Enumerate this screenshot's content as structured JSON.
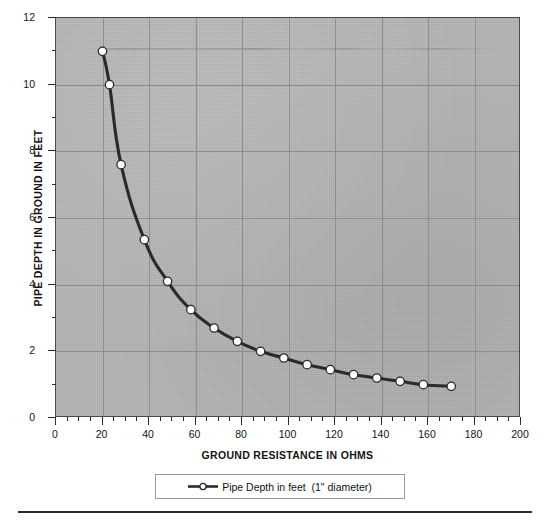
{
  "chart_data": {
    "type": "line",
    "title": "",
    "xlabel": "GROUND RESISTANCE IN OHMS",
    "ylabel": "PIPE DEPTH IN GROUND IN FEET",
    "xlim": [
      0,
      200
    ],
    "ylim": [
      0,
      12
    ],
    "x_major_ticks": [
      0,
      20,
      40,
      60,
      80,
      100,
      120,
      140,
      160,
      180,
      200
    ],
    "x_tick_labels": [
      "0",
      "20",
      "40",
      "60",
      "80",
      "100",
      "120",
      "140",
      "160",
      "180",
      "200"
    ],
    "x_minor_tick_step": 5,
    "y_major_ticks": [
      0,
      2,
      4,
      6,
      8,
      10,
      12
    ],
    "y_tick_labels": [
      "0",
      "2",
      "4",
      "6",
      "8",
      "10",
      "12"
    ],
    "y_minor_tick_step": 1,
    "grid": true,
    "grid_color": "#8e8e8e",
    "plot_background": "#b4b4b4",
    "legend_position": "below-axes",
    "series": [
      {
        "name": "Pipe Depth in feet  (1\" diameter)",
        "line_color": "#2a2a2a",
        "marker": "circle-open",
        "marker_fill": "#ffffff",
        "x": [
          20,
          23,
          28,
          38,
          48,
          58,
          68,
          78,
          88,
          98,
          108,
          118,
          128,
          138,
          148,
          158,
          170
        ],
        "y": [
          11.0,
          10.0,
          7.6,
          5.35,
          4.1,
          3.25,
          2.7,
          2.3,
          2.0,
          1.8,
          1.6,
          1.45,
          1.3,
          1.2,
          1.1,
          1.0,
          0.95
        ]
      }
    ]
  },
  "legend": {
    "label": "Pipe Depth in feet  (1\" diameter)"
  },
  "axes": {
    "x_title": "GROUND RESISTANCE IN OHMS",
    "y_title": "PIPE DEPTH IN GROUND IN FEET"
  }
}
